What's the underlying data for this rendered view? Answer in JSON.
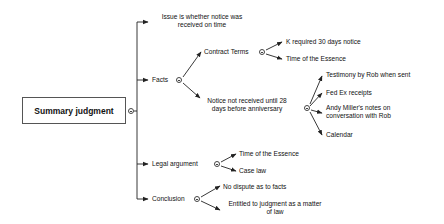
{
  "diagram": {
    "type": "mind-map",
    "root": {
      "label": "Summary judgment",
      "toggle": "collapse-icon",
      "children": [
        {
          "label": "Issue is whether notice was received on time",
          "lines": [
            "Issue is whether notice was",
            "received on time"
          ]
        },
        {
          "label": "Facts",
          "toggle": "collapse-icon",
          "children": [
            {
              "label": "Contract Terms",
              "toggle": "collapse-icon",
              "children": [
                {
                  "label": "K required 30 days notice"
                },
                {
                  "label": "Time of the Essence"
                }
              ]
            },
            {
              "label": "Notice not received until 28 days before anniversary",
              "lines": [
                "Notice not received until 28",
                "days before anniversary"
              ],
              "toggle": "collapse-icon",
              "children": [
                {
                  "label": "Testimony by Rob when sent"
                },
                {
                  "label": "Fed Ex receipts"
                },
                {
                  "label": "Andy Miller's notes on conversation with Rob",
                  "lines": [
                    "Andy Miller's notes on",
                    "conversation with Rob"
                  ]
                },
                {
                  "label": "Calendar"
                }
              ]
            }
          ]
        },
        {
          "label": "Legal argument",
          "toggle": "collapse-icon",
          "children": [
            {
              "label": "Time of the Essence"
            },
            {
              "label": "Case law"
            }
          ]
        },
        {
          "label": "Conclusion",
          "toggle": "collapse-icon",
          "children": [
            {
              "label": "No dispute as to facts"
            },
            {
              "label": "Entitled to judgment as a matter of law",
              "lines": [
                "Entitled to judgment as a matter",
                "of law"
              ]
            }
          ]
        }
      ]
    }
  },
  "colors": {
    "line": "#222222",
    "box_border": "#555555",
    "background": "#ffffff",
    "text": "#111111"
  }
}
